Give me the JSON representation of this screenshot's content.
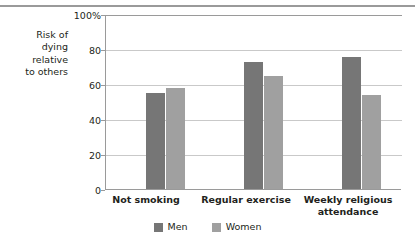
{
  "chart_data": {
    "type": "bar",
    "title": "",
    "subtitle": "",
    "xlabel": "",
    "ylabel": "Risk of dying relative to others",
    "ylabel_lines": [
      "Risk of",
      "dying",
      "relative",
      "to others"
    ],
    "categories": [
      "Not smoking",
      "Regular exercise",
      "Weekly religious attendance"
    ],
    "category_lines": [
      [
        "Not smoking"
      ],
      [
        "Regular exercise"
      ],
      [
        "Weekly religious",
        "attendance"
      ]
    ],
    "series": [
      {
        "name": "Men",
        "color": "#767676",
        "values": [
          55,
          73,
          76
        ]
      },
      {
        "name": "Women",
        "color": "#a0a0a0",
        "values": [
          58,
          65,
          54
        ]
      }
    ],
    "ylim": [
      0,
      100
    ],
    "ytick_values": [
      0,
      20,
      40,
      60,
      80,
      100
    ],
    "ytick_labels": [
      "0",
      "20",
      "40",
      "60",
      "80",
      "100%"
    ],
    "grid": true,
    "legend_position": "bottom",
    "legend_entries": [
      "Men",
      "Women"
    ]
  },
  "legend": {
    "items": [
      {
        "label": "Men",
        "color": "#767676"
      },
      {
        "label": "Women",
        "color": "#a0a0a0"
      }
    ]
  },
  "colors": {
    "men": "#767676",
    "women": "#a0a0a0",
    "axis": "#9a9a9a",
    "grid": "#c9c9c9",
    "text": "#231f20"
  }
}
